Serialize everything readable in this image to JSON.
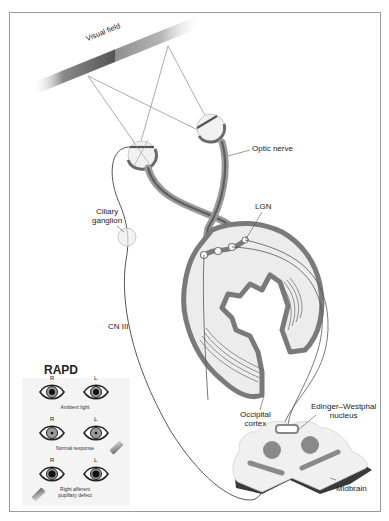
{
  "diagram": {
    "labels": {
      "visual_field": "Visual field",
      "optic_nerve": "Optic nerve",
      "lgn": "LGN",
      "ciliary_ganglion_line1": "Ciliary",
      "ciliary_ganglion_line2": "ganglion",
      "cn3": "CN III",
      "occipital_line1": "Occipital",
      "occipital_line2": "cortex",
      "ew_line1": "Edinger–Westphal",
      "ew_line2": "nucleus",
      "midbrain": "Midbrain"
    },
    "colors": {
      "nerve_gray": "#6e6e6e",
      "cortex_outline": "#7a7a7a",
      "cortex_fill": "#ececec",
      "midbrain_shadow": "#3a3a3a",
      "midbrain_feature": "#8a8a8a",
      "frame_border": "#9a9a9a"
    }
  },
  "rapd": {
    "title": "RAPD",
    "rows": [
      {
        "right_label": "R",
        "left_label": "L",
        "caption_line1": "Ambient light",
        "caption_line2": "",
        "light_source": "none"
      },
      {
        "right_label": "R",
        "left_label": "L",
        "caption_line1": "Normal response",
        "caption_line2": "",
        "light_source": "left"
      },
      {
        "right_label": "R",
        "left_label": "L",
        "caption_line1": "Right afferent",
        "caption_line2": "pupillary defect",
        "light_source": "right"
      }
    ]
  }
}
